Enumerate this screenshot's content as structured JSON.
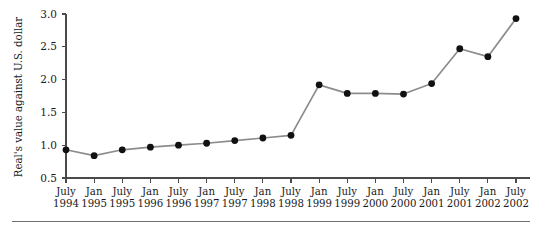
{
  "chart_data": {
    "type": "line",
    "title": "",
    "xlabel": "",
    "ylabel": "Real's value against U.S. dollar",
    "ylim": [
      0.5,
      3.0
    ],
    "yticks": [
      0.5,
      1.0,
      1.5,
      2.0,
      2.5,
      3.0
    ],
    "ytick_labels": [
      "0.5",
      "1.0",
      "1.5",
      "2.0",
      "2.5",
      "3.0"
    ],
    "grid": false,
    "legend": null,
    "categories": [
      "July 1994",
      "Jan 1995",
      "July 1995",
      "Jan 1996",
      "July 1996",
      "Jan 1997",
      "July 1997",
      "Jan 1998",
      "July 1998",
      "Jan 1999",
      "July 1999",
      "Jan 2000",
      "July 2000",
      "Jan 2001",
      "July 2001",
      "Jan 2002",
      "July 2002"
    ],
    "xtick_labels_line1": [
      "July",
      "Jan",
      "July",
      "Jan",
      "July",
      "Jan",
      "July",
      "Jan",
      "July",
      "Jan",
      "July",
      "Jan",
      "July",
      "Jan",
      "July",
      "Jan",
      "July"
    ],
    "xtick_labels_line2": [
      "1994",
      "1995",
      "1995",
      "1996",
      "1996",
      "1997",
      "1997",
      "1998",
      "1998",
      "1999",
      "1999",
      "2000",
      "2000",
      "2001",
      "2001",
      "2002",
      "2002"
    ],
    "values": [
      0.93,
      0.84,
      0.93,
      0.97,
      1.0,
      1.03,
      1.07,
      1.11,
      1.15,
      1.92,
      1.79,
      1.79,
      1.78,
      1.94,
      2.47,
      2.35,
      2.93
    ],
    "series": [
      {
        "name": "Real per U.S. dollar",
        "values": [
          0.93,
          0.84,
          0.93,
          0.97,
          1.0,
          1.03,
          1.07,
          1.11,
          1.15,
          1.92,
          1.79,
          1.79,
          1.78,
          1.94,
          2.47,
          2.35,
          2.93
        ]
      }
    ],
    "marker_color": "#111111",
    "line_color": "#8c8c8c",
    "axis_color": "#4a4a4a"
  }
}
